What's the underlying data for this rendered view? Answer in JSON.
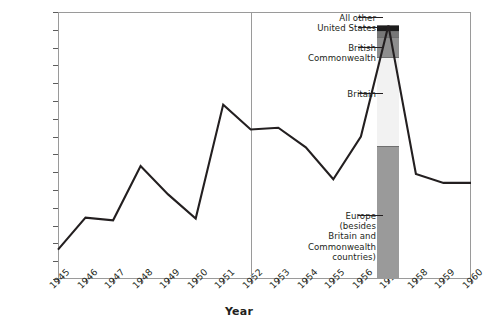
{
  "chart_data": {
    "type": "line",
    "title": "",
    "xlabel": "Year",
    "ylabel": "",
    "grid": false,
    "legend_position": "inline-callouts",
    "xlim": [
      1945,
      1960
    ],
    "ylim": [
      0,
      300000
    ],
    "ytick_step": 20000,
    "categories": [
      "1945",
      "1946",
      "1947",
      "1948",
      "1949",
      "1950",
      "1951",
      "1952",
      "1953",
      "1954",
      "1955",
      "1956",
      "1957",
      "1958",
      "1959",
      "1960"
    ],
    "x": [
      1945,
      1946,
      1947,
      1948,
      1949,
      1950,
      1951,
      1952,
      1953,
      1954,
      1955,
      1956,
      1957,
      1958,
      1959,
      1960
    ],
    "series": [
      {
        "name": "Immigration",
        "values": [
          33000,
          69000,
          66000,
          127000,
          95000,
          68000,
          196000,
          168000,
          170000,
          148000,
          112000,
          160000,
          285000,
          118000,
          108000,
          108000
        ]
      }
    ],
    "ytick_labels": [
      "0",
      "20 000",
      "40 000",
      "60 000",
      "80 000",
      "100 000",
      "120 000",
      "140 000",
      "160 000",
      "180 000",
      "200 000",
      "220 000",
      "240 000",
      "260 000",
      "280 000",
      "300 000"
    ],
    "ytick_values": [
      0,
      20000,
      40000,
      60000,
      80000,
      100000,
      120000,
      140000,
      160000,
      180000,
      200000,
      220000,
      240000,
      260000,
      280000,
      300000
    ],
    "xtick_labels": [
      "1945",
      "1946",
      "1947",
      "1948",
      "1949",
      "1950",
      "1951",
      "1952",
      "1953",
      "1954",
      "1955",
      "1956",
      "1957",
      "1958",
      "1959",
      "1960"
    ],
    "annotations": [
      {
        "type": "vertical-line",
        "x": 1952,
        "color": "#9a9a9a"
      }
    ],
    "stacked_bar": {
      "x": 1957,
      "total": 285000,
      "segments": [
        {
          "label": "Europe (besides Britain and Commonwealth countries)",
          "value": 149000,
          "from": 0,
          "to": 149000,
          "color": "#9a9a9a"
        },
        {
          "label": "Britain",
          "value": 100000,
          "from": 149000,
          "to": 249000,
          "color": "#f2f2f2"
        },
        {
          "label": "British Commonwealth",
          "value": 23000,
          "from": 249000,
          "to": 272000,
          "color": "#8e8e8e"
        },
        {
          "label": "United States",
          "value": 7000,
          "from": 272000,
          "to": 279000,
          "color": "#777777"
        },
        {
          "label": "All other",
          "value": 6000,
          "from": 279000,
          "to": 285000,
          "color": "#1d1d1d"
        }
      ]
    }
  },
  "callouts": {
    "all_other": "All other",
    "united_states": "United States",
    "british_commonwealth": "British\nCommonwealth",
    "britain": "Britain",
    "europe": "Europe\n(besides\nBritain and\nCommonwealth\ncountries)"
  },
  "axis": {
    "x_title": "Year"
  },
  "colors": {
    "line": "#231f20",
    "frame": "#9a9a9a",
    "divider": "#9a9a9a",
    "europe": "#9a9a9a",
    "britain": "#f2f2f2",
    "commonwealth": "#8e8e8e",
    "united_states": "#777777",
    "all_other": "#1d1d1d"
  }
}
